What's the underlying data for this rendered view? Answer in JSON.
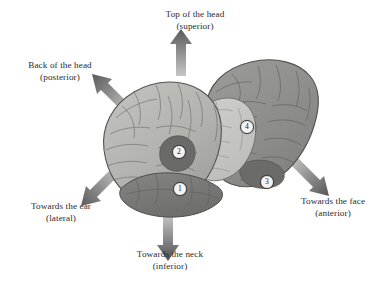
{
  "figure": {
    "type": "anatomical-diagram",
    "background_color": "#ffffff"
  },
  "direction_labels": [
    {
      "id": "superior",
      "line1": "Top of the head",
      "line2": "(superior)",
      "arrow": "up"
    },
    {
      "id": "posterior",
      "line1": "Back of the head",
      "line2": "(posterior)",
      "arrow": "up-left"
    },
    {
      "id": "lateral",
      "line1": "Towards the ear",
      "line2": "(lateral)",
      "arrow": "down-left"
    },
    {
      "id": "inferior",
      "line1": "Towards the neck",
      "line2": "(inferior)",
      "arrow": "down"
    },
    {
      "id": "anterior",
      "line1": "Towards the face",
      "line2": "(anterior)",
      "arrow": "down-right"
    }
  ],
  "markers": [
    {
      "id": 1,
      "label": "1"
    },
    {
      "id": 2,
      "label": "2"
    },
    {
      "id": 3,
      "label": "3"
    },
    {
      "id": 4,
      "label": "4"
    }
  ],
  "colors": {
    "text": "#2b2b2b",
    "arrow_dark": "#5e5e5e",
    "arrow_light": "#b9b9b9",
    "brain_front": "#b0b0ac",
    "brain_front_light": "#c4c4c0",
    "brain_rear": "#8e8e8c",
    "brain_inner_light": "#c9c9c5",
    "brain_temporal": "#7a7a78",
    "patch_dark": "#666664",
    "outline": "#53534f",
    "marker_fill": "#f4f3f1"
  }
}
